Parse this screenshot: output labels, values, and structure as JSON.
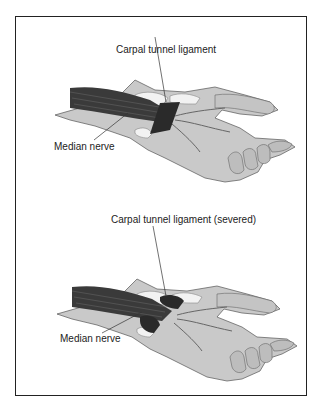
{
  "panels": [
    {
      "name": "before",
      "labels": {
        "ligament": "Carpal tunnel ligament",
        "nerve": "Median nerve"
      }
    },
    {
      "name": "after",
      "labels": {
        "ligament": "Carpal tunnel ligament (severed)",
        "nerve": "Median nerve"
      }
    }
  ],
  "colors": {
    "skin": "#c9c9c9",
    "skin_shadow": "#a8a8a8",
    "tendon": "#3a3a3a",
    "ligament": "#2a2a2a",
    "bone": "#f2f2f2",
    "border": "#222222"
  }
}
